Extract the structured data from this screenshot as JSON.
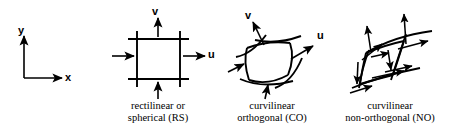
{
  "figure": {
    "background_color": "#ffffff",
    "ink_color": "#000000",
    "width": 455,
    "height": 134
  },
  "global_axes": {
    "name": "cartesian-reference-axes",
    "x_label": "x",
    "y_label": "y"
  },
  "panels": [
    {
      "id": "rs",
      "cell_type": "rectilinear",
      "caption_line1": "rectilinear or",
      "caption_line2": "spherical (RS)",
      "u_label": "u",
      "v_label": "v",
      "face_arrow_count": 4
    },
    {
      "id": "co",
      "cell_type": "curvilinear-orthogonal",
      "caption_line1": "curvilinear",
      "caption_line2": "orthogonal (CO)",
      "u_label": "u",
      "v_label": "v",
      "face_arrow_count": 4
    },
    {
      "id": "no",
      "cell_type": "curvilinear-non-orthogonal",
      "caption_line1": "curvilinear",
      "caption_line2": "non-orthogonal (NO)",
      "u_label": "",
      "v_label": "",
      "face_arrow_count": 8
    }
  ]
}
